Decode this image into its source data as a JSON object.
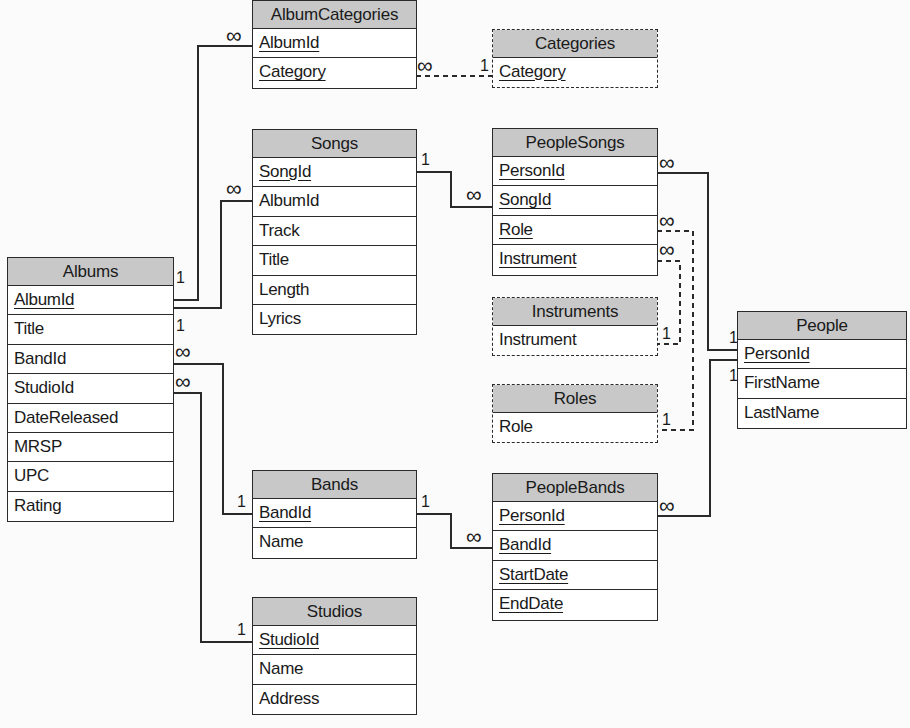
{
  "diagram": {
    "type": "entity-relationship",
    "tables": {
      "albums": {
        "name": "Albums",
        "fields": [
          {
            "name": "AlbumId",
            "key": true
          },
          {
            "name": "Title",
            "key": false
          },
          {
            "name": "BandId",
            "key": false
          },
          {
            "name": "StudioId",
            "key": false
          },
          {
            "name": "DateReleased",
            "key": false
          },
          {
            "name": "MRSP",
            "key": false
          },
          {
            "name": "UPC",
            "key": false
          },
          {
            "name": "Rating",
            "key": false
          }
        ]
      },
      "album_categories": {
        "name": "AlbumCategories",
        "fields": [
          {
            "name": "AlbumId",
            "key": true
          },
          {
            "name": "Category",
            "key": true
          }
        ]
      },
      "categories": {
        "name": "Categories",
        "lookup": true,
        "fields": [
          {
            "name": "Category",
            "key": true
          }
        ]
      },
      "songs": {
        "name": "Songs",
        "fields": [
          {
            "name": "SongId",
            "key": true
          },
          {
            "name": "AlbumId",
            "key": false
          },
          {
            "name": "Track",
            "key": false
          },
          {
            "name": "Title",
            "key": false
          },
          {
            "name": "Length",
            "key": false
          },
          {
            "name": "Lyrics",
            "key": false
          }
        ]
      },
      "people_songs": {
        "name": "PeopleSongs",
        "fields": [
          {
            "name": "PersonId",
            "key": true
          },
          {
            "name": "SongId",
            "key": true
          },
          {
            "name": "Role",
            "key": true
          },
          {
            "name": "Instrument",
            "key": true
          }
        ]
      },
      "instruments": {
        "name": "Instruments",
        "lookup": true,
        "fields": [
          {
            "name": "Instrument",
            "key": false
          }
        ]
      },
      "roles": {
        "name": "Roles",
        "lookup": true,
        "fields": [
          {
            "name": "Role",
            "key": false
          }
        ]
      },
      "people": {
        "name": "People",
        "fields": [
          {
            "name": "PersonId",
            "key": true
          },
          {
            "name": "FirstName",
            "key": false
          },
          {
            "name": "LastName",
            "key": false
          }
        ]
      },
      "bands": {
        "name": "Bands",
        "fields": [
          {
            "name": "BandId",
            "key": true
          },
          {
            "name": "Name",
            "key": false
          }
        ]
      },
      "people_bands": {
        "name": "PeopleBands",
        "fields": [
          {
            "name": "PersonId",
            "key": true
          },
          {
            "name": "BandId",
            "key": true
          },
          {
            "name": "StartDate",
            "key": true
          },
          {
            "name": "EndDate",
            "key": true
          }
        ]
      },
      "studios": {
        "name": "Studios",
        "fields": [
          {
            "name": "StudioId",
            "key": true
          },
          {
            "name": "Name",
            "key": false
          },
          {
            "name": "Address",
            "key": false
          }
        ]
      }
    },
    "relationships": [
      {
        "from": "Albums.AlbumId",
        "to": "AlbumCategories.AlbumId",
        "from_card": "1",
        "to_card": "∞",
        "style": "solid"
      },
      {
        "from": "Albums.AlbumId",
        "to": "Songs.AlbumId",
        "from_card": "1",
        "to_card": "∞",
        "style": "solid"
      },
      {
        "from": "Categories.Category",
        "to": "AlbumCategories.Category",
        "from_card": "1",
        "to_card": "∞",
        "style": "dashed"
      },
      {
        "from": "Songs.SongId",
        "to": "PeopleSongs.SongId",
        "from_card": "1",
        "to_card": "∞",
        "style": "solid"
      },
      {
        "from": "People.PersonId",
        "to": "PeopleSongs.PersonId",
        "from_card": "1",
        "to_card": "∞",
        "style": "solid"
      },
      {
        "from": "Instruments.Instrument",
        "to": "PeopleSongs.Instrument",
        "from_card": "1",
        "to_card": "∞",
        "style": "dashed"
      },
      {
        "from": "Roles.Role",
        "to": "PeopleSongs.Role",
        "from_card": "1",
        "to_card": "∞",
        "style": "dashed"
      },
      {
        "from": "Bands.BandId",
        "to": "Albums.BandId",
        "from_card": "1",
        "to_card": "∞",
        "style": "solid"
      },
      {
        "from": "Studios.StudioId",
        "to": "Albums.StudioId",
        "from_card": "1",
        "to_card": "∞",
        "style": "solid"
      },
      {
        "from": "Bands.BandId",
        "to": "PeopleBands.BandId",
        "from_card": "1",
        "to_card": "∞",
        "style": "solid"
      },
      {
        "from": "People.PersonId",
        "to": "PeopleBands.PersonId",
        "from_card": "1",
        "to_card": "∞",
        "style": "solid"
      }
    ],
    "cardinality_symbols": {
      "one": "1",
      "many": "∞"
    }
  },
  "colors": {
    "header_fill": "#c8c8c8",
    "line": "#2a2a2a",
    "background": "#fbfbfb"
  }
}
